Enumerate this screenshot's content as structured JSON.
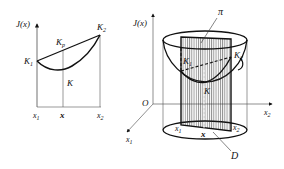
{
  "left_figure": {
    "y_axis_label": "J(x)",
    "points": {
      "k1": "K",
      "k1_sub": "1",
      "k2": "K",
      "k2_sub": "2",
      "kp": "K",
      "kp_sub": "p",
      "k": "K"
    },
    "x_ticks": {
      "x1": "x",
      "x1_sub": "1",
      "x": "x",
      "x2": "x",
      "x2_sub": "2"
    }
  },
  "right_figure": {
    "vertical_axis_label": "J(x)",
    "origin_label": "O",
    "plane_label": "π",
    "domain_label": "D",
    "points": {
      "k1": "K",
      "k1_sub": "1",
      "k2": "K",
      "k2_sub": "2",
      "k": "K"
    },
    "axes": {
      "x1_axis": "x",
      "x1_axis_sub": "1",
      "x2_axis": "x",
      "x2_axis_sub": "2"
    },
    "base_labels": {
      "x1": "x",
      "x1_sub": "1",
      "x": "x",
      "x2": "x",
      "x2_sub": "2"
    }
  }
}
